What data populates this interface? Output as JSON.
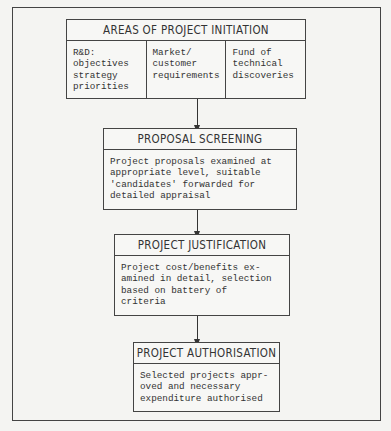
{
  "diagram": {
    "initiation": {
      "title": "AREAS OF PROJECT INITIATION",
      "columns": [
        "R&D:\nobjectives\nstrategy\npriorities",
        "Market/\ncustomer\nrequirements",
        "Fund of\ntechnical\ndiscoveries"
      ]
    },
    "screening": {
      "title": "PROPOSAL SCREENING",
      "text": "Project proposals examined at\nappropriate level, suitable\n'candidates' forwarded for\ndetailed appraisal"
    },
    "justification": {
      "title": "PROJECT JUSTIFICATION",
      "text": "Project cost/benefits ex-\namined in detail, selection\nbased on battery of\ncriteria"
    },
    "authorisation": {
      "title": "PROJECT AUTHORISATION",
      "text": "Selected projects appr-\noved and necessary\nexpenditure authorised"
    }
  }
}
